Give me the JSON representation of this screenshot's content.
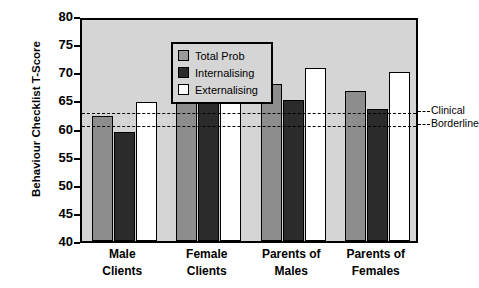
{
  "chart_data": {
    "type": "bar",
    "title": "",
    "xlabel": "",
    "ylabel": "Behaviour Checklist T-Score",
    "categories": [
      "Male Clients",
      "Female Clients",
      "Parents of Males",
      "Parents of Females"
    ],
    "category_lines": [
      [
        "Male",
        "Clients"
      ],
      [
        "Female",
        "Clients"
      ],
      [
        "Parents of",
        "Males"
      ],
      [
        "Parents of",
        "Females"
      ]
    ],
    "series": [
      {
        "name": "Total Prob",
        "color": "#8d8d8d",
        "values": [
          62.3,
          67.7,
          68.0,
          66.7
        ]
      },
      {
        "name": "Internalising",
        "color": "#2b2b2b",
        "values": [
          59.4,
          65.4,
          65.0,
          63.5
        ]
      },
      {
        "name": "Externalising",
        "color": "#ffffff",
        "values": [
          64.7,
          71.4,
          70.8,
          70.0
        ]
      }
    ],
    "ylim": [
      40,
      80
    ],
    "yticks": [
      80,
      75,
      70,
      65,
      60,
      55,
      50,
      45,
      40
    ],
    "ytick_labels": [
      "80",
      "75",
      "70",
      "65",
      "60",
      "55",
      "50",
      "45",
      "40"
    ],
    "grid": false,
    "legend_position": "top-left",
    "plot_background": "#d5d5d5",
    "reference_lines": [
      {
        "label": "Clinical",
        "value": 63.4
      },
      {
        "label": "Borderline",
        "value": 61.1
      }
    ]
  },
  "legend": {
    "items": [
      {
        "label": "Total Prob"
      },
      {
        "label": "Internalising"
      },
      {
        "label": "Externalising"
      }
    ]
  }
}
